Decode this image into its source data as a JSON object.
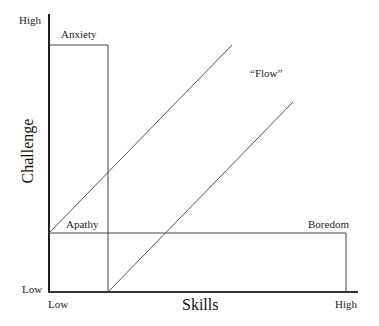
{
  "diagram": {
    "y_axis": {
      "title": "Challenge",
      "high_label": "High",
      "low_label": "Low"
    },
    "x_axis": {
      "title": "Skills",
      "high_label": "High",
      "low_label": "Low"
    },
    "regions": {
      "anxiety": "Anxiety",
      "apathy": "Apathy",
      "boredom": "Boredom",
      "flow": "“Flow”"
    },
    "colors": {
      "axis": "#222222",
      "line": "#444444",
      "background": "#ffffff"
    }
  }
}
